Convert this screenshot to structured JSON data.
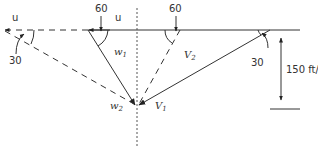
{
  "diagram": {
    "labels": {
      "u_left": "u",
      "u_top": "u",
      "angle_w1": "60",
      "angle_v2": "60",
      "angle_w2": "30",
      "angle_v1": "30",
      "w1": "w",
      "w1_sub": "1",
      "w2": "w",
      "w2_sub": "2",
      "v1": "V",
      "v1_sub": "1",
      "v2": "V",
      "v2_sub": "2",
      "height_dim": "150 ft/s"
    },
    "colors": {
      "line": "#333333",
      "background": "#ffffff"
    }
  }
}
